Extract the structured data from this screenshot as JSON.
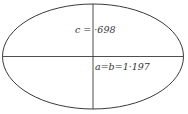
{
  "diagram": {
    "type": "ellipse-axes",
    "stroke_color": "#3a3a3a",
    "background": "#ffffff",
    "labels": {
      "minor_axis": "c = ·698",
      "major_axis": "a=b=1·197"
    },
    "values": {
      "c": 0.698,
      "a": 1.197,
      "b": 1.197
    }
  }
}
